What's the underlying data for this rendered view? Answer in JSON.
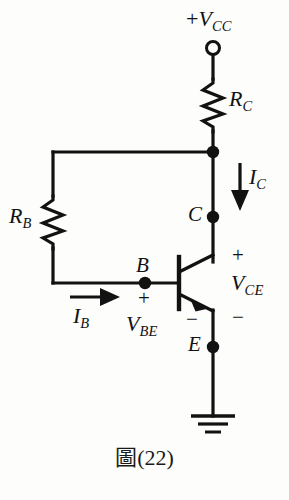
{
  "figure": {
    "caption": "圖(22)",
    "background_color": "#fdfdfb",
    "line_color": "#121212"
  },
  "labels": {
    "supply": {
      "sign": "+",
      "symbol": "V",
      "subscript": "CC"
    },
    "collector_resistor": {
      "symbol": "R",
      "subscript": "C"
    },
    "base_resistor": {
      "symbol": "R",
      "subscript": "B"
    },
    "collector_current": {
      "symbol": "I",
      "subscript": "C"
    },
    "base_current": {
      "symbol": "I",
      "subscript": "B"
    },
    "collector_emitter_voltage": {
      "symbol": "V",
      "subscript": "CE"
    },
    "base_emitter_voltage": {
      "symbol": "V",
      "subscript": "BE"
    },
    "terminal_base": "B",
    "terminal_collector": "C",
    "terminal_emitter": "E"
  },
  "polarity_signs": {
    "vce_plus": "+",
    "vce_minus": "−",
    "vbe_plus": "+",
    "vbe_minus": "−"
  },
  "components": [
    {
      "name": "supply-terminal",
      "type": "open-terminal",
      "label": "+VCC"
    },
    {
      "name": "collector-resistor",
      "type": "resistor",
      "label": "RC",
      "orientation": "vertical"
    },
    {
      "name": "base-resistor",
      "type": "resistor",
      "label": "RB",
      "orientation": "vertical"
    },
    {
      "name": "transistor",
      "type": "npn-bjt",
      "terminals": [
        "B",
        "C",
        "E"
      ]
    },
    {
      "name": "ground",
      "type": "earth-ground",
      "bars": 3
    }
  ],
  "current_arrows": [
    {
      "name": "collector-current-arrow",
      "label": "IC",
      "direction": "down"
    },
    {
      "name": "base-current-arrow",
      "label": "IB",
      "direction": "right"
    }
  ],
  "nodes": [
    {
      "name": "supply-node",
      "x": 213,
      "y": 152,
      "filled": true
    },
    {
      "name": "collector-node",
      "x": 213,
      "y": 217,
      "filled": true
    },
    {
      "name": "base-node",
      "x": 145,
      "y": 283,
      "filled": true
    },
    {
      "name": "emitter-node",
      "x": 213,
      "y": 347,
      "filled": true
    }
  ]
}
